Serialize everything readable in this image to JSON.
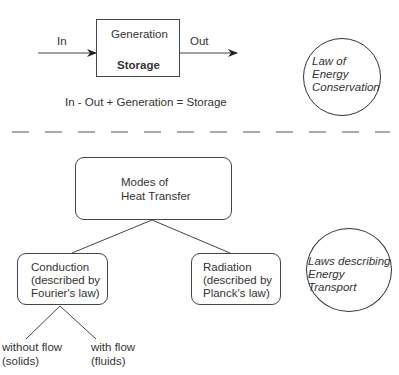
{
  "top_section": {
    "in_label": "In",
    "out_label": "Out",
    "box": {
      "top_label": "Generation",
      "bottom_label": "Storage"
    },
    "equation": "In - Out + Generation = Storage",
    "circle": {
      "line1": "Law of",
      "line2": "Energy",
      "line3": "Conservation"
    }
  },
  "bottom_section": {
    "root": {
      "line1": "Modes of",
      "line2": "Heat Transfer"
    },
    "conduction": {
      "line1": "Conduction",
      "line2": "(described by",
      "line3": "Fourier's law)"
    },
    "radiation": {
      "line1": "Radiation",
      "line2": "(described by",
      "line3": "Planck's law)"
    },
    "without_flow": {
      "line1": "without flow",
      "line2": "(solids)"
    },
    "with_flow": {
      "line1": "with flow",
      "line2": "(fluids)"
    },
    "circle": {
      "line1": "Laws describing",
      "line2": "Energy",
      "line3": "Transport"
    }
  },
  "colors": {
    "stroke": "#333333",
    "background": "#ffffff"
  }
}
